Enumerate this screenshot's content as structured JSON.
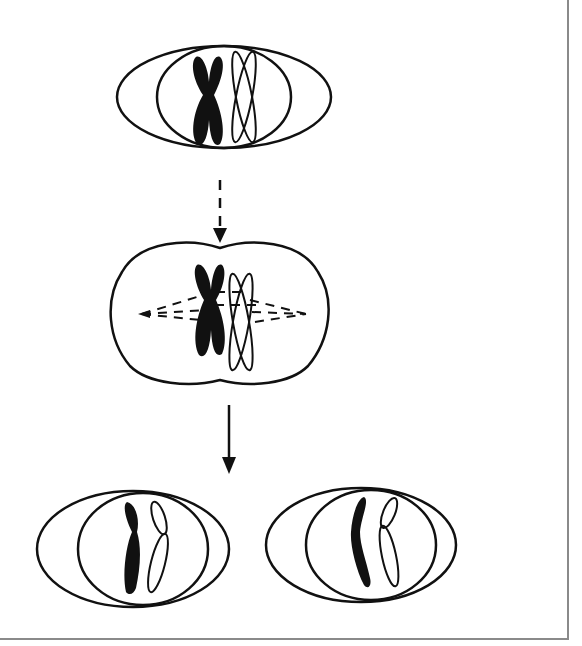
{
  "diagram": {
    "description": "Cell division diagram: a cell with a homologous chromosome pair (one dark, one light) divides through a metaphase-like stage with spindle fibers into two daughter cells, each receiving one chromatid of each chromosome.",
    "colors": {
      "stroke": "#111111",
      "dark_chromosome": "#111111",
      "light_chromosome": "#ffffff",
      "frame_border": "#8a8a8a",
      "background": "#ffffff"
    },
    "stages": [
      {
        "id": "parent-cell",
        "label": "Parent cell with paired chromosomes",
        "chromosomes": [
          "dark-duplicated",
          "light-duplicated"
        ]
      },
      {
        "id": "dividing-cell",
        "label": "Dividing cell with spindle fibers",
        "chromosomes": [
          "dark-duplicated",
          "light-duplicated"
        ],
        "spindle": "dashed-fibers-to-poles"
      },
      {
        "id": "daughter-cell-left",
        "label": "Daughter cell 1",
        "chromosomes": [
          "dark-single",
          "light-single"
        ]
      },
      {
        "id": "daughter-cell-right",
        "label": "Daughter cell 2",
        "chromosomes": [
          "dark-single",
          "light-single"
        ]
      }
    ],
    "arrows": [
      {
        "id": "arrow-1",
        "style": "dashed",
        "from": "parent-cell",
        "to": "dividing-cell"
      },
      {
        "id": "arrow-2",
        "style": "solid",
        "from": "dividing-cell",
        "to": "daughter-cells"
      }
    ]
  }
}
